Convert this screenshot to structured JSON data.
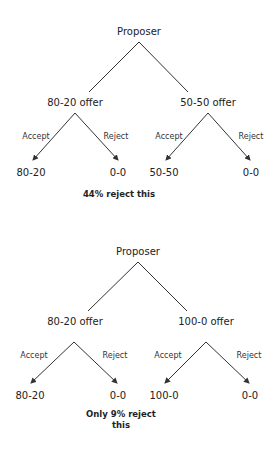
{
  "trees": [
    {
      "root": "Proposer",
      "offers": [
        {
          "label": "80-20 offer",
          "accept_label": "Accept",
          "reject_label": "Reject",
          "accept_outcome": "80-20",
          "reject_outcome": "0-0"
        },
        {
          "label": "50-50 offer",
          "accept_label": "Accept",
          "reject_label": "Reject",
          "accept_outcome": "50-50",
          "reject_outcome": "0-0"
        }
      ],
      "note": "44% reject this"
    },
    {
      "root": "Proposer",
      "offers": [
        {
          "label": "80-20 offer",
          "accept_label": "Accept",
          "reject_label": "Reject",
          "accept_outcome": "80-20",
          "reject_outcome": "0-0"
        },
        {
          "label": "100-0 offer",
          "accept_label": "Accept",
          "reject_label": "Reject",
          "accept_outcome": "100-0",
          "reject_outcome": "0-0"
        }
      ],
      "note_line1": "Only 9% reject",
      "note_line2": "this"
    }
  ],
  "colors": {
    "line": "#333333",
    "text": "#222222",
    "background": "#ffffff"
  }
}
